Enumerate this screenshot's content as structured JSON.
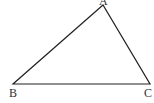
{
  "diagram": {
    "type": "triangle",
    "stroke_color": "#222222",
    "vertices": [
      {
        "label": "A",
        "x": 103,
        "y": 5
      },
      {
        "label": "B",
        "x": 13,
        "y": 84
      },
      {
        "label": "C",
        "x": 150,
        "y": 84
      }
    ]
  }
}
